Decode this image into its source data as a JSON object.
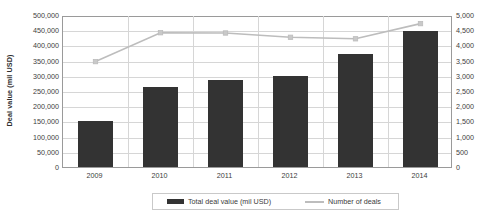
{
  "chart_data": {
    "type": "bar",
    "title": "",
    "subtitle": "",
    "xlabel": "",
    "ylabel": "Deal value (mil USD)",
    "y2label": "",
    "categories": [
      "2009",
      "2010",
      "2011",
      "2012",
      "2013",
      "2014"
    ],
    "series": [
      {
        "name": "Total deal value (mil USD)",
        "type": "bar",
        "axis": "left",
        "color": "#333333",
        "values": [
          150000,
          262000,
          285000,
          298000,
          372000,
          448000
        ]
      },
      {
        "name": "Number of deals",
        "type": "line",
        "axis": "right",
        "color": "#bdbdbd",
        "values": [
          3500,
          4450,
          4440,
          4300,
          4250,
          4750
        ]
      }
    ],
    "ylim": [
      0,
      500000
    ],
    "y2lim": [
      0,
      5000
    ],
    "yticks": [
      0,
      50000,
      100000,
      150000,
      200000,
      250000,
      300000,
      350000,
      400000,
      450000,
      500000
    ],
    "ytick_labels": [
      "0",
      "50,000",
      "100,000",
      "150,000",
      "200,000",
      "250,000",
      "300,000",
      "350,000",
      "400,000",
      "450,000",
      "500,000"
    ],
    "y2ticks": [
      0,
      500,
      1000,
      1500,
      2000,
      2500,
      3000,
      3500,
      4000,
      4500,
      5000
    ],
    "y2tick_labels": [
      "0",
      "500",
      "1,000",
      "1,500",
      "2,000",
      "2,500",
      "3,000",
      "3,500",
      "4,000",
      "4,500",
      "5,000"
    ],
    "grid": true,
    "legend_position": "bottom",
    "legend": [
      {
        "label": "Total deal value (mil USD)",
        "marker": "bar-swatch",
        "color": "#333333"
      },
      {
        "label": "Number of deals",
        "marker": "line-swatch",
        "color": "#bdbdbd"
      }
    ]
  }
}
